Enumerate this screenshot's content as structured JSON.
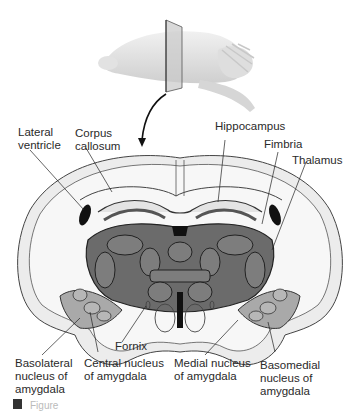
{
  "figure": {
    "type": "coronal brain section diagram (rodent) with amygdala nuclei",
    "colors": {
      "background": "#ffffff",
      "brain_outline": "#ececec",
      "white_matter": "#f4f4f4",
      "thalamus_fill": "#6b6b6b",
      "amygdala_fill": "#a9a9a9",
      "ventricle": "#111111",
      "line": "#333333"
    },
    "labels": {
      "lateral_ventricle": "Lateral\nventricle",
      "corpus_callosum": "Corpus\ncallosum",
      "hippocampus": "Hippocampus",
      "fimbria": "Fimbria",
      "thalamus": "Thalamus",
      "fornix": "Fornix",
      "basolateral_nucleus": "Basolateral\nnucleus of\namygdala",
      "central_nucleus": "Central nucleus\nof amygdala",
      "medial_nucleus": "Medial nucleus\nof amygdala",
      "basomedial_nucleus": "Basomedial\nnucleus of\namygdala"
    },
    "caption": {
      "visible_text": "Figure"
    }
  }
}
